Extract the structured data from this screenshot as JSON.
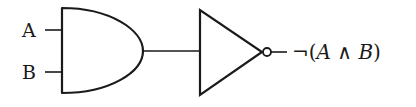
{
  "diagram": {
    "type": "logic-circuit",
    "gates": [
      {
        "id": "and-gate",
        "kind": "AND",
        "inputs": [
          "A",
          "B"
        ]
      },
      {
        "id": "not-gate",
        "kind": "NOT",
        "inputs": [
          "and-gate"
        ]
      }
    ],
    "inputs": {
      "a_label": "A",
      "b_label": "B"
    },
    "output": {
      "neg": "¬(",
      "a": "A",
      "op": " ∧ ",
      "b": "B",
      "close": ")"
    },
    "colors": {
      "stroke": "#1a1a1a",
      "background": "#ffffff"
    }
  }
}
